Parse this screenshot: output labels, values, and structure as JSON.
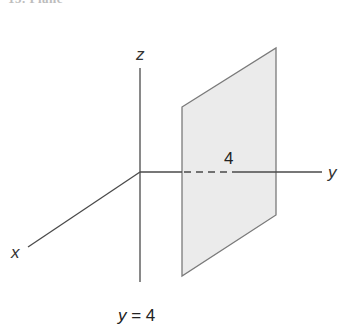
{
  "heading": {
    "text": "15. Plane"
  },
  "diagram": {
    "axes": {
      "x_label": "x",
      "y_label": "y",
      "z_label": "z"
    },
    "plane": {
      "label": "4",
      "fill": "#ebebeb",
      "stroke": "#7a7a7a"
    },
    "axis_color": "#4a4a4a"
  },
  "caption": {
    "variable": "y",
    "equals": " = 4"
  }
}
